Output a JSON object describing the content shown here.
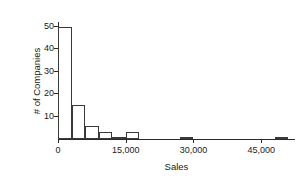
{
  "chart_data": {
    "type": "bar",
    "title": "",
    "subtitle": "",
    "xlabel": "Sales",
    "ylabel": "# of Companies",
    "grid": false,
    "legend": false,
    "legend_position": "none",
    "bin_width": 3000,
    "xlim": [
      0,
      52500
    ],
    "ylim": [
      0,
      52
    ],
    "xticks": [
      0,
      15000,
      30000,
      45000
    ],
    "xtick_labels": [
      "0",
      "15,000",
      "30,000",
      "45,000"
    ],
    "yticks": [
      10,
      20,
      30,
      40,
      50
    ],
    "ytick_labels": [
      "10",
      "20",
      "30",
      "40",
      "50"
    ],
    "bar_color": "#ffffff",
    "bar_edge_color": "#3a3a3a",
    "axis_color": "#2b2b2b",
    "bins": [
      {
        "x0": 0,
        "x1": 3000,
        "value": 50
      },
      {
        "x0": 3000,
        "x1": 6000,
        "value": 15
      },
      {
        "x0": 6000,
        "x1": 9000,
        "value": 6
      },
      {
        "x0": 9000,
        "x1": 12000,
        "value": 3
      },
      {
        "x0": 12000,
        "x1": 15000,
        "value": 1
      },
      {
        "x0": 15000,
        "x1": 18000,
        "value": 3
      },
      {
        "x0": 27000,
        "x1": 30000,
        "value": 1
      },
      {
        "x0": 48000,
        "x1": 51000,
        "value": 1
      }
    ],
    "categories": [
      "0-3,000",
      "3,000-6,000",
      "6,000-9,000",
      "9,000-12,000",
      "12,000-15,000",
      "15,000-18,000",
      "27,000-30,000",
      "48,000-51,000"
    ],
    "values": [
      50,
      15,
      6,
      3,
      1,
      3,
      1,
      1
    ]
  }
}
